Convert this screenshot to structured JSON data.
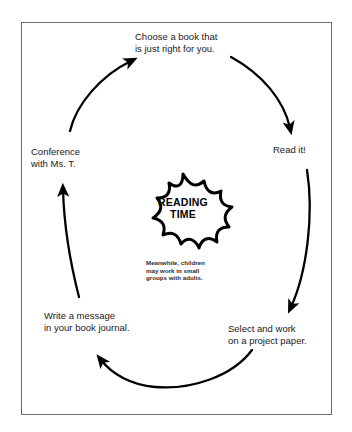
{
  "diagram": {
    "frame": {
      "border_color": "#6b6b6b",
      "background_color": "#ffffff"
    },
    "center": {
      "shape": "starburst",
      "label": "READING\nTIME",
      "note": "Meanwhile, children\nmay work in small\ngroups with adults.",
      "stroke_color": "#000000",
      "fill_color": "#ffffff"
    },
    "stroke_color": "#000000",
    "text_color": "#1a1a1a",
    "nodes": [
      {
        "id": "choose",
        "label": "Choose a book that\nis just right for you.",
        "position": "top"
      },
      {
        "id": "read",
        "label": "Read it!",
        "position": "right"
      },
      {
        "id": "select",
        "label": "Select and work\non a project paper.",
        "position": "bottom-right"
      },
      {
        "id": "write",
        "label": "Write a message\nin your book journal.",
        "position": "bottom-left"
      },
      {
        "id": "conference",
        "label": "Conference\nwith Ms. T.",
        "position": "left"
      }
    ],
    "arrows": [
      {
        "id": "conference-to-choose",
        "from": "conference",
        "to": "choose"
      },
      {
        "id": "choose-to-read",
        "from": "choose",
        "to": "read"
      },
      {
        "id": "read-to-select",
        "from": "read",
        "to": "select"
      },
      {
        "id": "select-to-write",
        "from": "select",
        "to": "write"
      },
      {
        "id": "write-to-conference",
        "from": "write",
        "to": "conference"
      }
    ]
  }
}
